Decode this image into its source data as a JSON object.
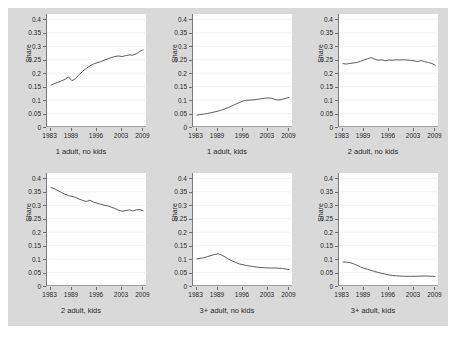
{
  "figure": {
    "background_color": "#d9d9d9",
    "panel_background": "#ffffff",
    "line_color": "#4a4a4a",
    "axis_color": "#7b7b7b",
    "grid_color": "#ededed"
  },
  "axes": {
    "ylabel": "Share",
    "yticks": [
      "0",
      "0.05",
      "0.1",
      "0.15",
      "0.2",
      "0.25",
      "0.3",
      "0.35",
      "0.4"
    ],
    "ytick_values": [
      0,
      0.05,
      0.1,
      0.15,
      0.2,
      0.25,
      0.3,
      0.35,
      0.4
    ],
    "ylim": [
      0,
      0.42
    ],
    "xticks": [
      "1983",
      "1989",
      "1996",
      "2003",
      "2009"
    ],
    "xtick_values": [
      1983,
      1989,
      1996,
      2003,
      2009
    ],
    "xlim": [
      1982,
      2010
    ]
  },
  "chart_data": {
    "type": "line",
    "title": "",
    "xlabel": "",
    "ylabel": "Share",
    "xlim": [
      1982,
      2010
    ],
    "ylim": [
      0,
      0.42
    ],
    "grid": true,
    "legend": "none",
    "x": [
      1983,
      1984,
      1985,
      1986,
      1987,
      1988,
      1989,
      1990,
      1991,
      1992,
      1993,
      1994,
      1995,
      1996,
      1997,
      1998,
      1999,
      2000,
      2001,
      2002,
      2003,
      2004,
      2005,
      2006,
      2007,
      2008,
      2009
    ],
    "panels": [
      {
        "id": "one-adult-no-kids",
        "caption": "1 adult, no kids",
        "row": 0,
        "col": 0,
        "values": [
          0.155,
          0.161,
          0.166,
          0.171,
          0.177,
          0.186,
          0.172,
          0.18,
          0.195,
          0.207,
          0.218,
          0.227,
          0.234,
          0.239,
          0.243,
          0.248,
          0.253,
          0.258,
          0.262,
          0.264,
          0.262,
          0.265,
          0.268,
          0.267,
          0.272,
          0.281,
          0.288
        ]
      },
      {
        "id": "one-adult-kids",
        "caption": "1 adult, kids",
        "row": 0,
        "col": 1,
        "values": [
          0.044,
          0.046,
          0.048,
          0.05,
          0.053,
          0.056,
          0.059,
          0.063,
          0.068,
          0.073,
          0.079,
          0.085,
          0.091,
          0.097,
          0.099,
          0.1,
          0.101,
          0.103,
          0.105,
          0.107,
          0.108,
          0.107,
          0.102,
          0.1,
          0.103,
          0.107,
          0.11
        ]
      },
      {
        "id": "two-adult-no-kids",
        "caption": "2 adult, no kids",
        "row": 0,
        "col": 2,
        "values": [
          0.236,
          0.234,
          0.236,
          0.238,
          0.24,
          0.244,
          0.249,
          0.254,
          0.258,
          0.252,
          0.248,
          0.25,
          0.246,
          0.249,
          0.248,
          0.25,
          0.249,
          0.25,
          0.249,
          0.248,
          0.246,
          0.243,
          0.247,
          0.243,
          0.24,
          0.236,
          0.229
        ]
      },
      {
        "id": "two-adult-kids",
        "caption": "2 adult, kids",
        "row": 1,
        "col": 0,
        "values": [
          0.366,
          0.362,
          0.355,
          0.348,
          0.341,
          0.336,
          0.333,
          0.329,
          0.323,
          0.318,
          0.314,
          0.319,
          0.312,
          0.308,
          0.304,
          0.3,
          0.298,
          0.293,
          0.288,
          0.282,
          0.278,
          0.28,
          0.283,
          0.279,
          0.283,
          0.284,
          0.28
        ]
      },
      {
        "id": "three-plus-adult-no-kids",
        "caption": "3+ adult, no kids",
        "row": 1,
        "col": 1,
        "values": [
          0.101,
          0.103,
          0.105,
          0.109,
          0.113,
          0.117,
          0.12,
          0.115,
          0.108,
          0.1,
          0.093,
          0.087,
          0.082,
          0.079,
          0.076,
          0.074,
          0.072,
          0.07,
          0.069,
          0.068,
          0.067,
          0.067,
          0.067,
          0.066,
          0.065,
          0.063,
          0.061
        ]
      },
      {
        "id": "three-plus-adult-kids",
        "caption": "3+ adult, kids",
        "row": 1,
        "col": 2,
        "values": [
          0.089,
          0.089,
          0.087,
          0.083,
          0.077,
          0.071,
          0.066,
          0.062,
          0.058,
          0.054,
          0.05,
          0.047,
          0.044,
          0.041,
          0.039,
          0.038,
          0.037,
          0.036,
          0.036,
          0.036,
          0.036,
          0.036,
          0.037,
          0.037,
          0.037,
          0.036,
          0.035
        ]
      }
    ]
  }
}
